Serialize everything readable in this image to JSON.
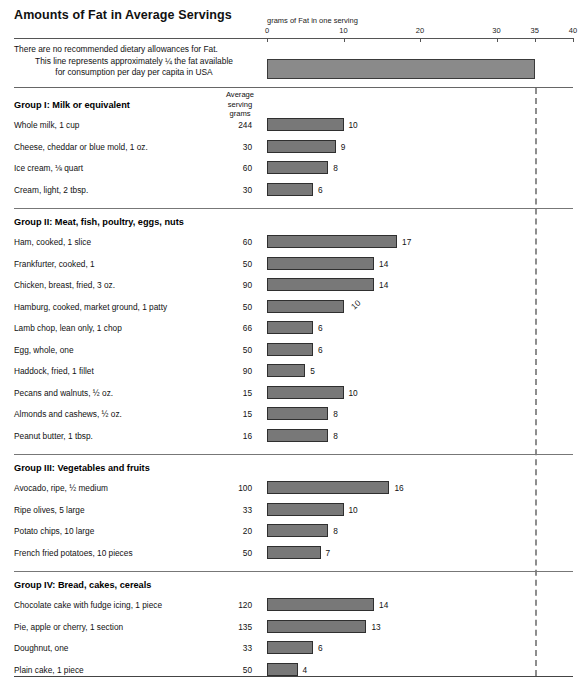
{
  "title": "Amounts of Fat in Average Servings",
  "axis": {
    "caption": "grams of Fat in one serving",
    "ticks": [
      0,
      10,
      20,
      30,
      35,
      40
    ],
    "min": 0,
    "max": 40
  },
  "note": {
    "line1": "There are no recommended dietary allowances for Fat.",
    "line2": "This line represents approximately ¼ the fat available",
    "line3": "for consumption per day per capita in USA",
    "bar_value": 35
  },
  "column_header": {
    "line1": "Average",
    "line2": "serving",
    "line3": "grams"
  },
  "reference_line_value": 35,
  "colors": {
    "bar_fill": "#787878",
    "bar_stroke": "#2f2f2f",
    "note_bar_fill": "#8a8a8a",
    "rule": "#777777",
    "dashed_line": "#8d8d8d",
    "text": "#111111"
  },
  "chart_data": {
    "type": "bar",
    "title": "Amounts of Fat in Average Servings",
    "xlabel": "grams of Fat in one serving",
    "ylabel": "",
    "xlim": [
      0,
      40
    ],
    "xticks": [
      0,
      10,
      20,
      30,
      35,
      40
    ],
    "grid": false,
    "legend": null,
    "orientation": "horizontal",
    "annotations": [
      "There are no recommended dietary allowances for Fat.",
      "This line represents approximately ¼ the fat available",
      "for consumption per day per capita in USA"
    ],
    "reference_bar": {
      "label": "¼ of per capita daily fat available in USA",
      "value": 35
    },
    "groups": [
      {
        "name": "Group I: Milk or equivalent",
        "rows": [
          {
            "label": "Whole milk, 1 cup",
            "grams": "244",
            "value": 10,
            "value_label": "10",
            "rotated": false
          },
          {
            "label": "Cheese, cheddar or blue mold, 1 oz.",
            "grams": "30",
            "value": 9,
            "value_label": "9",
            "rotated": false
          },
          {
            "label": "Ice cream, ⅛ quart",
            "grams": "60",
            "value": 8,
            "value_label": "8",
            "rotated": false
          },
          {
            "label": "Cream, light, 2 tbsp.",
            "grams": "30",
            "value": 6,
            "value_label": "6",
            "rotated": false
          }
        ]
      },
      {
        "name": "Group II: Meat, fish, poultry, eggs, nuts",
        "rows": [
          {
            "label": "Ham, cooked, 1 slice",
            "grams": "60",
            "value": 17,
            "value_label": "17",
            "rotated": false
          },
          {
            "label": "Frankfurter, cooked, 1",
            "grams": "50",
            "value": 14,
            "value_label": "14",
            "rotated": false
          },
          {
            "label": "Chicken, breast, fried, 3 oz.",
            "grams": "90",
            "value": 14,
            "value_label": "14",
            "rotated": false
          },
          {
            "label": "Hamburg, cooked, market ground, 1 patty",
            "grams": "50",
            "value": 10,
            "value_label": "10",
            "rotated": true
          },
          {
            "label": "Lamb chop, lean only, 1 chop",
            "grams": "66",
            "value": 6,
            "value_label": "6",
            "rotated": false
          },
          {
            "label": "Egg, whole, one",
            "grams": "50",
            "value": 6,
            "value_label": "6",
            "rotated": false
          },
          {
            "label": "Haddock, fried, 1 fillet",
            "grams": "90",
            "value": 5,
            "value_label": "5",
            "rotated": false
          },
          {
            "label": "Pecans and walnuts, ½ oz.",
            "grams": "15",
            "value": 10,
            "value_label": "10",
            "rotated": false
          },
          {
            "label": "Almonds and cashews, ½ oz.",
            "grams": "15",
            "value": 8,
            "value_label": "8",
            "rotated": false
          },
          {
            "label": "Peanut butter, 1 tbsp.",
            "grams": "16",
            "value": 8,
            "value_label": "8",
            "rotated": false
          }
        ]
      },
      {
        "name": "Group III: Vegetables and fruits",
        "rows": [
          {
            "label": "Avocado, ripe, ½ medium",
            "grams": "100",
            "value": 16,
            "value_label": "16",
            "rotated": false
          },
          {
            "label": "Ripe olives, 5 large",
            "grams": "33",
            "value": 10,
            "value_label": "10",
            "rotated": false
          },
          {
            "label": "Potato chips, 10 large",
            "grams": "20",
            "value": 8,
            "value_label": "8",
            "rotated": false
          },
          {
            "label": "French fried potatoes, 10 pieces",
            "grams": "50",
            "value": 7,
            "value_label": "7",
            "rotated": false
          }
        ]
      },
      {
        "name": "Group IV: Bread, cakes, cereals",
        "rows": [
          {
            "label": "Chocolate cake with fudge icing, 1 piece",
            "grams": "120",
            "value": 14,
            "value_label": "14",
            "rotated": false
          },
          {
            "label": "Pie, apple or cherry, 1 section",
            "grams": "135",
            "value": 13,
            "value_label": "13",
            "rotated": false
          },
          {
            "label": "Doughnut, one",
            "grams": "33",
            "value": 6,
            "value_label": "6",
            "rotated": false
          },
          {
            "label": "Plain cake, 1 piece",
            "grams": "50",
            "value": 4,
            "value_label": "4",
            "rotated": false
          }
        ]
      },
      {
        "name": "Fats and oils",
        "rows": [
          {
            "label": "Salad oil, 1 tbsp.",
            "grams": "14",
            "value": 14,
            "value_label": "14",
            "rotated": false
          },
          {
            "label": "Butter or margarine, 1 tbsp.",
            "grams": "14",
            "value": 11,
            "value_label": "11",
            "rotated": false
          }
        ]
      }
    ]
  }
}
